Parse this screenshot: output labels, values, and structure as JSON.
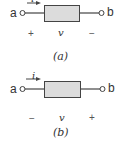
{
  "figures": [
    {
      "id": "a",
      "caption": "(a)",
      "terminal_left": "a",
      "terminal_right": "b",
      "current_label": "i",
      "voltage_label": "v",
      "left_sign": "+",
      "right_sign": "−"
    },
    {
      "id": "b",
      "caption": "(b)",
      "terminal_left": "a",
      "terminal_right": "b",
      "current_label": "i",
      "voltage_label": "v",
      "left_sign": "−",
      "right_sign": "+"
    }
  ],
  "colors": {
    "element_fill": "#dcdcdc",
    "element_stroke": "#444444",
    "wire": "#444444"
  }
}
